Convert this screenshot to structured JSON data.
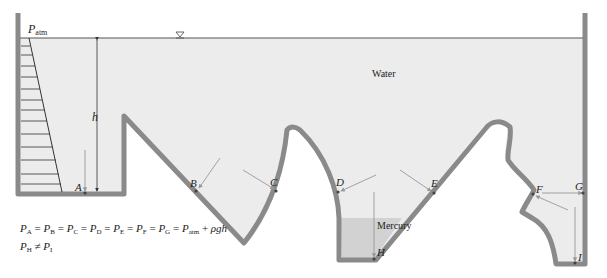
{
  "diagram": {
    "labels": {
      "p_atm": "P",
      "p_atm_sub": "atm",
      "water": "Water",
      "mercury": "Mercury",
      "h": "h",
      "free_surface_symbol": "▽"
    },
    "points": [
      "A",
      "B",
      "C",
      "D",
      "E",
      "F",
      "G",
      "H",
      "I"
    ],
    "points_map": {
      "A": "A",
      "B": "B",
      "C": "C",
      "D": "D",
      "E": "E",
      "F": "F",
      "G": "G",
      "H": "H",
      "I": "I"
    },
    "equations": {
      "line1": "P_A = P_B = P_C = P_D = P_E = P_F = P_G = P_atm + ρgh",
      "line2": "P_H ≠ P_I"
    },
    "colors": {
      "water": "#ececec",
      "mercury": "#d2d2d2",
      "wall": "#8a8a8a",
      "line": "#333333",
      "arrow": "#999999"
    }
  }
}
